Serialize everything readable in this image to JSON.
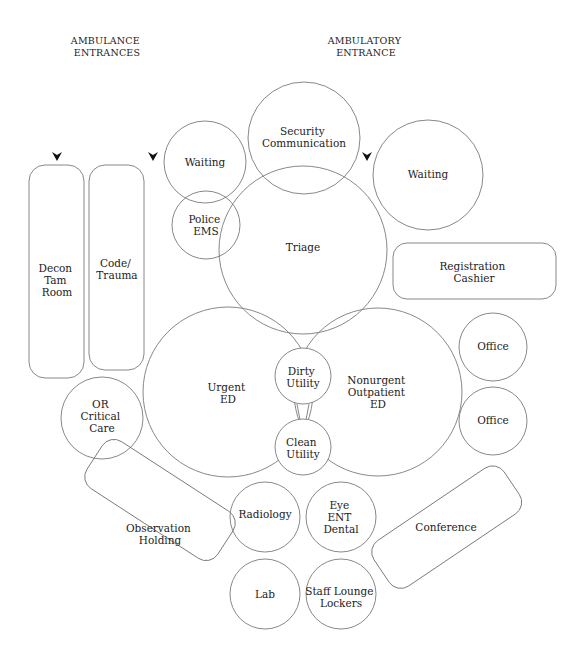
{
  "headers": {
    "ambulance": [
      "AMBULANCE",
      "ENTRANCES"
    ],
    "ambulatory": [
      "AMBULATORY",
      "ENTRANCE"
    ]
  },
  "entrance_arrows": [
    {
      "name": "ambulance-entrance-arrow-1",
      "x": 57,
      "y": 156
    },
    {
      "name": "ambulance-entrance-arrow-2",
      "x": 153,
      "y": 156
    },
    {
      "name": "ambulatory-entrance-arrow",
      "x": 367,
      "y": 156
    }
  ],
  "rooms": {
    "security_communication": [
      "Security",
      "Communication"
    ],
    "waiting_left": [
      "Waiting"
    ],
    "waiting_right": [
      "Waiting"
    ],
    "police_ems": [
      "Police",
      "EMS"
    ],
    "triage": [
      "Triage"
    ],
    "registration_cashier": [
      "Registration",
      "Cashier"
    ],
    "decon_tam_room": [
      "Decon",
      "Tam",
      "Room"
    ],
    "code_trauma": [
      "Code/",
      "Trauma"
    ],
    "urgent_ed": [
      "Urgent",
      "ED"
    ],
    "dirty_utility": [
      "Dirty",
      "Utility"
    ],
    "clean_utility": [
      "Clean",
      "Utility"
    ],
    "nonurgent_outpatient_ed": [
      "Nonurgent",
      "Outpatient",
      "ED"
    ],
    "office_1": [
      "Office"
    ],
    "office_2": [
      "Office"
    ],
    "or_critical_care": [
      "OR",
      "Critical",
      "Care"
    ],
    "observation_holding": [
      "Observation",
      "Holding"
    ],
    "radiology": [
      "Radiology"
    ],
    "eye_ent_dental": [
      "Eye",
      "ENT",
      "Dental"
    ],
    "conference": [
      "Conference"
    ],
    "lab": [
      "Lab"
    ],
    "staff_lounge_lockers": [
      "Staff Lounge",
      "Lockers"
    ]
  }
}
